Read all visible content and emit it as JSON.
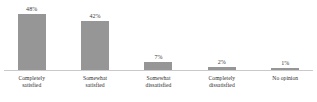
{
  "chart_data": {
    "type": "bar",
    "title": "",
    "subtitle": "",
    "xlabel": "",
    "ylabel": "",
    "ylim": [
      0,
      60
    ],
    "grid": false,
    "legend": false,
    "orientation": "vertical",
    "value_suffix": "%",
    "categories": [
      "Completely satisfied",
      "Somewhat satisfied",
      "Somewhat dissatisfied",
      "Completely dissatisfied",
      "No opinion"
    ],
    "values": [
      48,
      42,
      7,
      2,
      1
    ],
    "bars": [
      {
        "value_label": "48%",
        "value": 48,
        "category_line1": "Completely",
        "category_line2": "satisfied",
        "height_px": 56
      },
      {
        "value_label": "42%",
        "value": 42,
        "category_line1": "Somewhat",
        "category_line2": "satisfied",
        "height_px": 49
      },
      {
        "value_label": "7%",
        "value": 7,
        "category_line1": "Somewhat",
        "category_line2": "dissatisfied",
        "height_px": 8
      },
      {
        "value_label": "2%",
        "value": 2,
        "category_line1": "Completely",
        "category_line2": "dissatisfied",
        "height_px": 3
      },
      {
        "value_label": "1%",
        "value": 1,
        "category_line1": "No opinion",
        "category_line2": "",
        "height_px": 2
      }
    ]
  },
  "style": {
    "bar_color": "#969696",
    "baseline_color": "#c9c9c9",
    "background_color": "#ffffff",
    "value_text_color": "#3b3b3b",
    "category_text_color": "#2e2e2e"
  }
}
